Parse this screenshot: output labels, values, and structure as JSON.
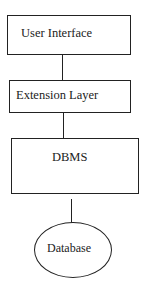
{
  "diagram": {
    "type": "layered-architecture",
    "nodes": [
      {
        "id": "ui",
        "label": "User Interface",
        "shape": "rectangle"
      },
      {
        "id": "ext",
        "label": "Extension Layer",
        "shape": "rectangle"
      },
      {
        "id": "dbms",
        "label": "DBMS",
        "shape": "rectangle"
      },
      {
        "id": "db",
        "label": "Database",
        "shape": "ellipse"
      }
    ],
    "edges": [
      {
        "from": "ui",
        "to": "ext"
      },
      {
        "from": "ext",
        "to": "dbms"
      },
      {
        "from": "dbms",
        "to": "db"
      }
    ]
  }
}
